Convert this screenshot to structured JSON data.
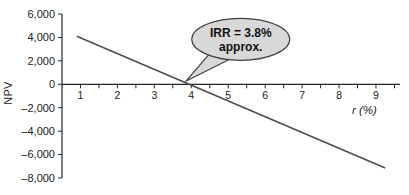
{
  "chart_data": {
    "type": "line",
    "title": "",
    "xlabel": "r (%)",
    "ylabel": "NPV",
    "xlim": [
      0.5,
      9.65
    ],
    "ylim": [
      -8000,
      6000
    ],
    "grid": false,
    "legend": false,
    "axis_color": "#262626",
    "x_ticks_labeled": [
      1,
      2,
      3,
      4,
      5,
      6,
      7,
      8,
      9
    ],
    "x_minor_step": 0.5,
    "x_tick_range": [
      1,
      9.5
    ],
    "y_ticks": [
      6000,
      4000,
      2000,
      0,
      -2000,
      -4000,
      -6000,
      -8000
    ],
    "y_tick_labels": [
      "6,000",
      "4,000",
      "2,000",
      "0",
      "–2,000",
      "–4,000",
      "–6,000",
      "–8,000"
    ],
    "series": [
      {
        "name": "NPV as a function of discount rate r",
        "color": "#4d4d4d",
        "points": [
          {
            "x": 0.9,
            "y": 4100
          },
          {
            "x": 9.25,
            "y": -7150
          }
        ]
      }
    ],
    "annotation": {
      "label_line1": "IRR = 3.8%",
      "label_line2": "approx.",
      "target": {
        "x": 3.85,
        "y": 0
      },
      "bubble_fill": "#d8d8d8",
      "bubble_stroke": "#404040",
      "text_color": "#111111"
    }
  }
}
